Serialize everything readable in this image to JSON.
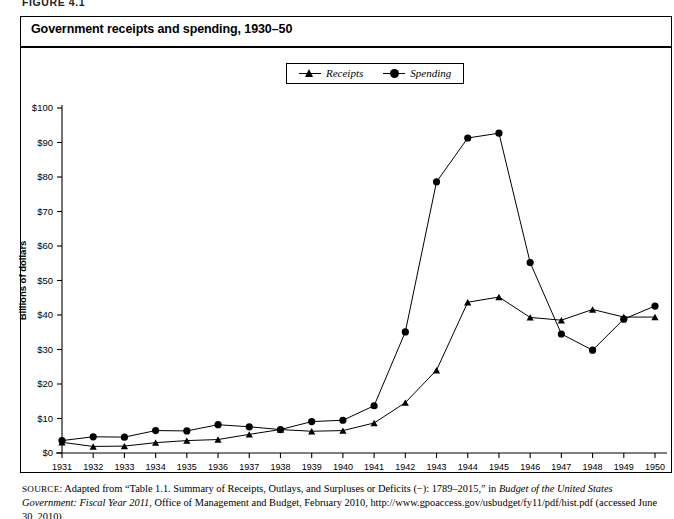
{
  "figure": {
    "label": "FIGURE 4.1",
    "title": "Government receipts and spending, 1930–50"
  },
  "legend": {
    "position": "top-center",
    "items": [
      {
        "label": "Receipts",
        "marker": "triangle-marker-icon"
      },
      {
        "label": "Spending",
        "marker": "circle-marker-icon"
      }
    ]
  },
  "axes": {
    "ylabel": "Billions of dollars",
    "ytick_labels": [
      "$0",
      "$10",
      "$20",
      "$30",
      "$40",
      "$50",
      "$60",
      "$70",
      "$80",
      "$90",
      "$100"
    ],
    "xtick_labels": [
      "1931",
      "1932",
      "1933",
      "1934",
      "1935",
      "1936",
      "1937",
      "1938",
      "1939",
      "1940",
      "1941",
      "1942",
      "1943",
      "1944",
      "1945",
      "1946",
      "1947",
      "1948",
      "1949",
      "1950"
    ]
  },
  "source": {
    "prefix": "SOURCE",
    "text_1": ": Adapted from “Table 1.1. Summary of Receipts, Outlays, and Surpluses or Deficits (−): 1789–2015,” in ",
    "italic_1": "Budget of the United States Government: Fiscal Year 2011",
    "text_2": ", Office of Management and Budget, February 2010, http://www.gpoaccess.gov/usbudget/fy11/pdf/hist.pdf (accessed June 30, 2010)"
  },
  "chart_data": {
    "type": "line",
    "title": "Government receipts and spending, 1930–50",
    "xlabel": "",
    "ylabel": "Billions of dollars",
    "xlim": [
      1931,
      1950
    ],
    "ylim": [
      0,
      100
    ],
    "ytick_step": 10,
    "grid": false,
    "legend_position": "top-center",
    "x": [
      1931,
      1932,
      1933,
      1934,
      1935,
      1936,
      1937,
      1938,
      1939,
      1940,
      1941,
      1942,
      1943,
      1944,
      1945,
      1946,
      1947,
      1948,
      1949,
      1950
    ],
    "series": [
      {
        "name": "Receipts",
        "marker": "triangle",
        "color": "#000000",
        "values": [
          3.1,
          1.9,
          2.0,
          3.0,
          3.6,
          3.9,
          5.4,
          6.8,
          6.3,
          6.5,
          8.7,
          14.6,
          24.0,
          43.7,
          45.2,
          39.3,
          38.5,
          41.6,
          39.4,
          39.4
        ]
      },
      {
        "name": "Spending",
        "marker": "circle",
        "color": "#000000",
        "values": [
          3.6,
          4.7,
          4.6,
          6.5,
          6.4,
          8.2,
          7.6,
          6.8,
          9.1,
          9.5,
          13.7,
          35.1,
          78.6,
          91.3,
          92.7,
          55.2,
          34.5,
          29.8,
          38.8,
          42.6
        ]
      }
    ]
  }
}
